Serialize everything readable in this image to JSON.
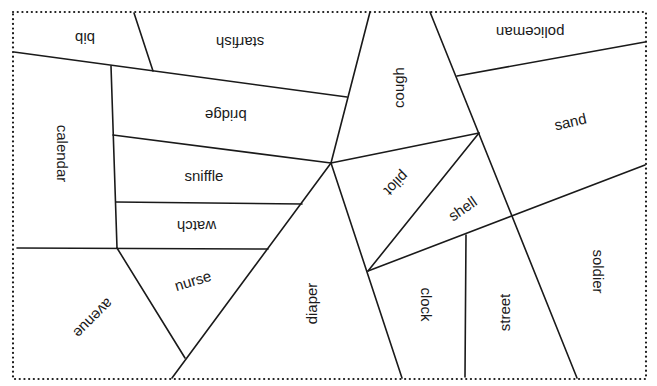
{
  "puzzle": {
    "border_style": "dotted",
    "line_color": "#1a1a1a",
    "regions": [
      {
        "id": "bib",
        "label": "bib",
        "x": 85,
        "y": 38,
        "rotate": 180
      },
      {
        "id": "starfish",
        "label": "starfish",
        "x": 240,
        "y": 42,
        "rotate": 180
      },
      {
        "id": "cough",
        "label": "cough",
        "x": 398,
        "y": 87,
        "rotate": -90
      },
      {
        "id": "policeman",
        "label": "policeman",
        "x": 530,
        "y": 32,
        "rotate": 180
      },
      {
        "id": "calendar",
        "label": "calendar",
        "x": 63,
        "y": 153,
        "rotate": 90
      },
      {
        "id": "bridge",
        "label": "bridge",
        "x": 226,
        "y": 115,
        "rotate": 180
      },
      {
        "id": "sand",
        "label": "sand",
        "x": 570,
        "y": 121,
        "rotate": -13
      },
      {
        "id": "sniffle",
        "label": "sniffle",
        "x": 204,
        "y": 175,
        "rotate": 0
      },
      {
        "id": "pilot",
        "label": "pilot",
        "x": 397,
        "y": 183,
        "rotate": 135
      },
      {
        "id": "shell",
        "label": "shell",
        "x": 462,
        "y": 208,
        "rotate": -35
      },
      {
        "id": "watch",
        "label": "watch",
        "x": 196,
        "y": 226,
        "rotate": 180
      },
      {
        "id": "soldier",
        "label": "soldier",
        "x": 598,
        "y": 271,
        "rotate": 90
      },
      {
        "id": "nurse",
        "label": "nurse",
        "x": 193,
        "y": 280,
        "rotate": -17
      },
      {
        "id": "diaper",
        "label": "diaper",
        "x": 312,
        "y": 303,
        "rotate": -90
      },
      {
        "id": "clock",
        "label": "clock",
        "x": 426,
        "y": 304,
        "rotate": 90
      },
      {
        "id": "avenue",
        "label": "avenue",
        "x": 93,
        "y": 318,
        "rotate": 135
      },
      {
        "id": "street",
        "label": "street",
        "x": 505,
        "y": 312,
        "rotate": -90
      }
    ]
  }
}
